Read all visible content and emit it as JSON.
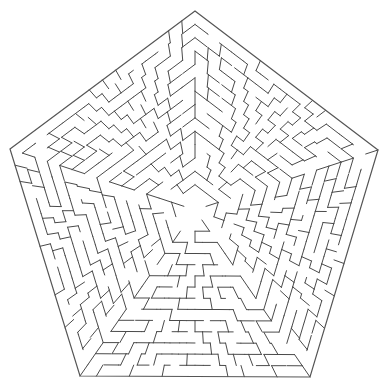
{
  "image": {
    "kind": "pentagonal-maze",
    "background": "#ffffff",
    "wall_color": "#4a4a4a",
    "outer_wall_color": "#555555"
  },
  "maze": {
    "shape": "pentagon",
    "vertices": [
      [
        195,
        11
      ],
      [
        378,
        150
      ],
      [
        310,
        377
      ],
      [
        80,
        376
      ],
      [
        10,
        149
      ]
    ],
    "center": [
      195,
      210
    ],
    "rings": 14,
    "cells_per_side_outer": 14,
    "sectors": 5,
    "entrance": "none visible",
    "exit": "none visible"
  }
}
